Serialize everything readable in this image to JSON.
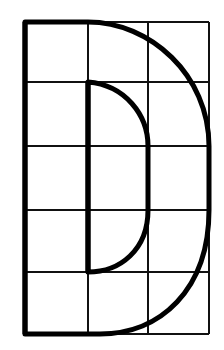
{
  "diagram": {
    "letter": "D",
    "grid": {
      "columns": 3,
      "rows": 5,
      "x_lines": [
        25,
        88,
        148,
        209
      ],
      "y_lines": [
        22,
        82,
        146,
        210,
        272,
        334
      ],
      "line_color": "#111111",
      "line_width": 2
    },
    "outer_stroke": {
      "color": "#000000",
      "width": 5
    },
    "inner_stroke": {
      "color": "#000000",
      "width": 5
    },
    "background": "#ffffff"
  }
}
